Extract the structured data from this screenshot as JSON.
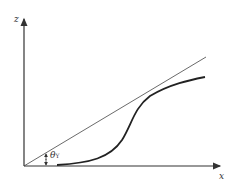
{
  "diagram": {
    "axes": {
      "vertical_label": "z",
      "horizontal_label": "x"
    },
    "angle_label": {
      "symbol": "θ",
      "subscript": "Y"
    },
    "colors": {
      "axis": "#333333",
      "line": "#444444",
      "curve": "#222222"
    }
  }
}
